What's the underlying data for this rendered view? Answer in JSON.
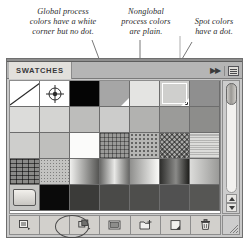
{
  "annotations": [
    {
      "text": "Global process\ncolors have a white\ncorner but no dot."
    },
    {
      "text": "Nonglobal\nprocess colors\nare plain."
    },
    {
      "text": "Spot colors\nhave a dot."
    }
  ],
  "panel": {
    "tab_label": "SWATCHES",
    "collapse_label": "▶▶",
    "menu_icon": "panel-menu-icon"
  },
  "scrollbar": {
    "up_arrow": "scroll-up-arrow",
    "down_arrow": "scroll-down-arrow",
    "thumb": "scrollbar-thumb"
  },
  "toolbar": {
    "buttons": [
      {
        "name": "swatch-libraries-menu-button",
        "icon": "swatch-libraries-icon"
      },
      {
        "name": "toolbar-spacer",
        "icon": "none"
      },
      {
        "name": "show-swatch-kinds-menu-button",
        "icon": "swatch-kinds-icon"
      },
      {
        "name": "swatch-options-button",
        "icon": "swatch-options-icon"
      },
      {
        "name": "new-color-group-button",
        "icon": "new-color-group-icon"
      },
      {
        "name": "new-swatch-button",
        "icon": "new-swatch-icon"
      },
      {
        "name": "delete-swatch-button",
        "icon": "trash-icon"
      }
    ]
  },
  "swatches": {
    "columns": 7,
    "items": [
      {
        "name": "none-swatch",
        "kind": "none",
        "color": "#ffffff",
        "marker": "none"
      },
      {
        "name": "registration-swatch",
        "kind": "registration",
        "color": "#ffffff",
        "marker": "none"
      },
      {
        "name": "black-swatch",
        "kind": "solid",
        "color": "#050505",
        "marker": "none"
      },
      {
        "name": "gray-global-swatch",
        "kind": "solid",
        "color": "#a6a6a6",
        "marker": "corner"
      },
      {
        "name": "light-plain-swatch",
        "kind": "solid",
        "color": "#e4e4e2",
        "marker": "none"
      },
      {
        "name": "spot-color-swatch",
        "kind": "solid",
        "color": "#cfcfcd",
        "marker": "dot",
        "selected": true
      },
      {
        "name": "midgray-swatch",
        "kind": "solid",
        "color": "#8f8f8f",
        "marker": "none"
      },
      {
        "name": "tint-swatch-1",
        "kind": "solid",
        "color": "#dcdcda",
        "marker": "none"
      },
      {
        "name": "tint-swatch-2",
        "kind": "solid",
        "color": "#d4d4d2",
        "marker": "none"
      },
      {
        "name": "tint-swatch-3",
        "kind": "solid",
        "color": "#bdbdbb",
        "marker": "none"
      },
      {
        "name": "tint-swatch-4",
        "kind": "solid",
        "color": "#cccccb",
        "marker": "none"
      },
      {
        "name": "tint-swatch-5",
        "kind": "solid",
        "color": "#b2b2b0",
        "marker": "none"
      },
      {
        "name": "tint-swatch-6",
        "kind": "solid",
        "color": "#9b9b99",
        "marker": "none"
      },
      {
        "name": "tint-swatch-7",
        "kind": "solid",
        "color": "#8d8d8b",
        "marker": "none"
      },
      {
        "name": "tint-swatch-8",
        "kind": "solid",
        "color": "#cececc",
        "marker": "none"
      },
      {
        "name": "tint-swatch-9",
        "kind": "solid",
        "color": "#bfbfbd",
        "marker": "none"
      },
      {
        "name": "white-swatch",
        "kind": "solid",
        "color": "#fbfbfa",
        "marker": "none"
      },
      {
        "name": "pattern-plaid-swatch",
        "kind": "pattern",
        "color": "#9a9a98",
        "pattern": "plaid"
      },
      {
        "name": "pattern-dots-swatch",
        "kind": "pattern",
        "color": "#b6b6b4",
        "pattern": "dots"
      },
      {
        "name": "pattern-zigzag-swatch",
        "kind": "pattern",
        "color": "#a8a8a6",
        "pattern": "zigzag"
      },
      {
        "name": "pattern-fine-swatch",
        "kind": "pattern",
        "color": "#dcdcda",
        "pattern": "fine"
      },
      {
        "name": "pattern-brick-swatch",
        "kind": "pattern",
        "color": "#8a8a88",
        "pattern": "brick"
      },
      {
        "name": "pattern-speckle-swatch",
        "kind": "pattern",
        "color": "#c3c3c1",
        "pattern": "speckle"
      },
      {
        "name": "gradient-swatch-1",
        "kind": "gradient",
        "color": "#bdbdbb",
        "gradient": "ltr-dark"
      },
      {
        "name": "gradient-swatch-2",
        "kind": "gradient",
        "color": "#9e9e9c",
        "gradient": "center-dark"
      },
      {
        "name": "gradient-swatch-3",
        "kind": "gradient",
        "color": "#cacac8",
        "gradient": "ltr-light"
      },
      {
        "name": "gradient-swatch-4",
        "kind": "gradient",
        "color": "#5a5a58",
        "gradient": "dark-band"
      },
      {
        "name": "gradient-swatch-5",
        "kind": "gradient",
        "color": "#b4b4b2",
        "gradient": "soft"
      },
      {
        "name": "color-group-folder",
        "kind": "folder",
        "color": "#c6c6c4",
        "marker": "none"
      },
      {
        "name": "dark-swatch-1",
        "kind": "solid",
        "color": "#0a0a0a",
        "marker": "none"
      },
      {
        "name": "dark-swatch-2",
        "kind": "solid",
        "color": "#3b3b39",
        "marker": "none"
      },
      {
        "name": "dark-swatch-3",
        "kind": "solid",
        "color": "#4a4a48",
        "marker": "none"
      },
      {
        "name": "dark-swatch-4",
        "kind": "solid",
        "color": "#4e4e4c",
        "marker": "none"
      },
      {
        "name": "dark-swatch-5",
        "kind": "solid",
        "color": "#515151",
        "marker": "none"
      },
      {
        "name": "dark-swatch-6",
        "kind": "solid",
        "color": "#565654",
        "marker": "none"
      }
    ]
  }
}
